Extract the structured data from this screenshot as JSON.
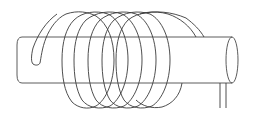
{
  "diagram": {
    "title": "Solenoid coil wound around a cylindrical core",
    "subject": "solenoid",
    "colors": {
      "background": "#ffffff",
      "line": "#3a3a3a"
    },
    "components": [
      {
        "id": "core",
        "label": "cylindrical core"
      },
      {
        "id": "coil",
        "label": "helical wire coil",
        "turns": 6
      },
      {
        "id": "leads",
        "label": "wire leads",
        "count": 2
      }
    ]
  }
}
